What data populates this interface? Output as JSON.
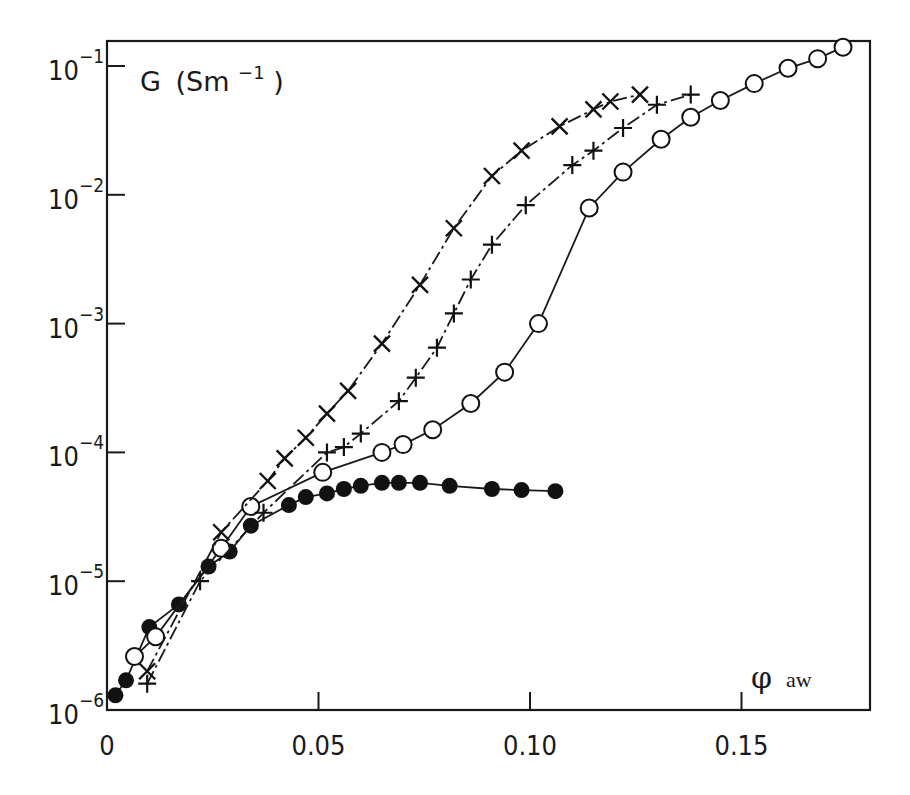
{
  "chart_data": {
    "type": "scatter",
    "title": "",
    "xlabel": "φ aw",
    "ylabel": "G (Sm⁻¹)",
    "x_tick_labels": [
      "0",
      "0.05",
      "0.10",
      "0.15"
    ],
    "x_ticks": [
      0,
      0.05,
      0.1,
      0.15
    ],
    "y_tick_labels": [
      "10⁻⁶",
      "10⁻⁵",
      "10⁻⁴",
      "10⁻³",
      "10⁻²",
      "10⁻¹"
    ],
    "y_ticks": [
      1e-06,
      1e-05,
      0.0001,
      0.001,
      0.01,
      0.1
    ],
    "xlim": [
      0,
      0.18
    ],
    "ylim": [
      1e-06,
      0.16
    ],
    "yscale": "log",
    "grid": false,
    "legend": "none",
    "series": [
      {
        "name": "filled circles",
        "marker": "filled-circle",
        "line": "solid",
        "x": [
          0.002,
          0.0045,
          0.01,
          0.017,
          0.024,
          0.029,
          0.034,
          0.043,
          0.047,
          0.052,
          0.056,
          0.06,
          0.065,
          0.069,
          0.074,
          0.081,
          0.091,
          0.098,
          0.106
        ],
        "y": [
          1.3e-06,
          1.7e-06,
          4.4e-06,
          6.6e-06,
          1.3e-05,
          1.7e-05,
          2.7e-05,
          3.9e-05,
          4.5e-05,
          4.8e-05,
          5.2e-05,
          5.5e-05,
          5.8e-05,
          5.8e-05,
          5.8e-05,
          5.5e-05,
          5.2e-05,
          5.1e-05,
          5e-05
        ]
      },
      {
        "name": "open circles",
        "marker": "open-circle",
        "line": "solid",
        "x": [
          0.0065,
          0.0115,
          0.027,
          0.034,
          0.051,
          0.065,
          0.07,
          0.077,
          0.086,
          0.094,
          0.102,
          0.114,
          0.122,
          0.131,
          0.138,
          0.145,
          0.153,
          0.161,
          0.168,
          0.174
        ],
        "y": [
          2.6e-06,
          3.7e-06,
          1.8e-05,
          3.8e-05,
          7e-05,
          0.0001,
          0.000115,
          0.00015,
          0.00024,
          0.00042,
          0.001,
          0.0079,
          0.015,
          0.027,
          0.04,
          0.054,
          0.073,
          0.096,
          0.114,
          0.14
        ]
      },
      {
        "name": "plus",
        "marker": "plus",
        "line": "dash-dot",
        "x": [
          0.0095,
          0.022,
          0.037,
          0.052,
          0.056,
          0.06,
          0.069,
          0.073,
          0.078,
          0.082,
          0.086,
          0.091,
          0.099,
          0.11,
          0.115,
          0.122,
          0.13,
          0.138
        ],
        "y": [
          1.6e-06,
          1e-05,
          3.4e-05,
          0.0001,
          0.00011,
          0.00014,
          0.00025,
          0.00038,
          0.00065,
          0.0012,
          0.0022,
          0.0041,
          0.0083,
          0.017,
          0.022,
          0.033,
          0.05,
          0.06
        ]
      },
      {
        "name": "cross",
        "marker": "x",
        "line": "dash-dot",
        "x": [
          0.0095,
          0.027,
          0.038,
          0.042,
          0.047,
          0.052,
          0.057,
          0.065,
          0.074,
          0.082,
          0.091,
          0.098,
          0.107,
          0.115,
          0.119,
          0.126
        ],
        "y": [
          2e-06,
          2.4e-05,
          6e-05,
          9e-05,
          0.00013,
          0.0002,
          0.0003,
          0.0007,
          0.002,
          0.0055,
          0.014,
          0.022,
          0.034,
          0.046,
          0.053,
          0.06
        ]
      }
    ],
    "annotations": [
      {
        "text": "G (Sm⁻¹)",
        "position": "top-left inside plot"
      },
      {
        "text": "φ aw",
        "position": "bottom-right inside plot"
      }
    ]
  },
  "labels": {
    "y_axis_title_main": "G",
    "y_axis_title_unit": "(Sm",
    "y_axis_title_exp": "−1",
    "y_axis_title_close": ")",
    "x_axis_title_symbol": "φ",
    "x_axis_title_sub": "aw",
    "y_base": "10",
    "y_exps": [
      "−6",
      "−5",
      "−4",
      "−3",
      "−2",
      "−1"
    ],
    "x_ticks": [
      "0",
      "0.05",
      "0.10",
      "0.15"
    ]
  }
}
